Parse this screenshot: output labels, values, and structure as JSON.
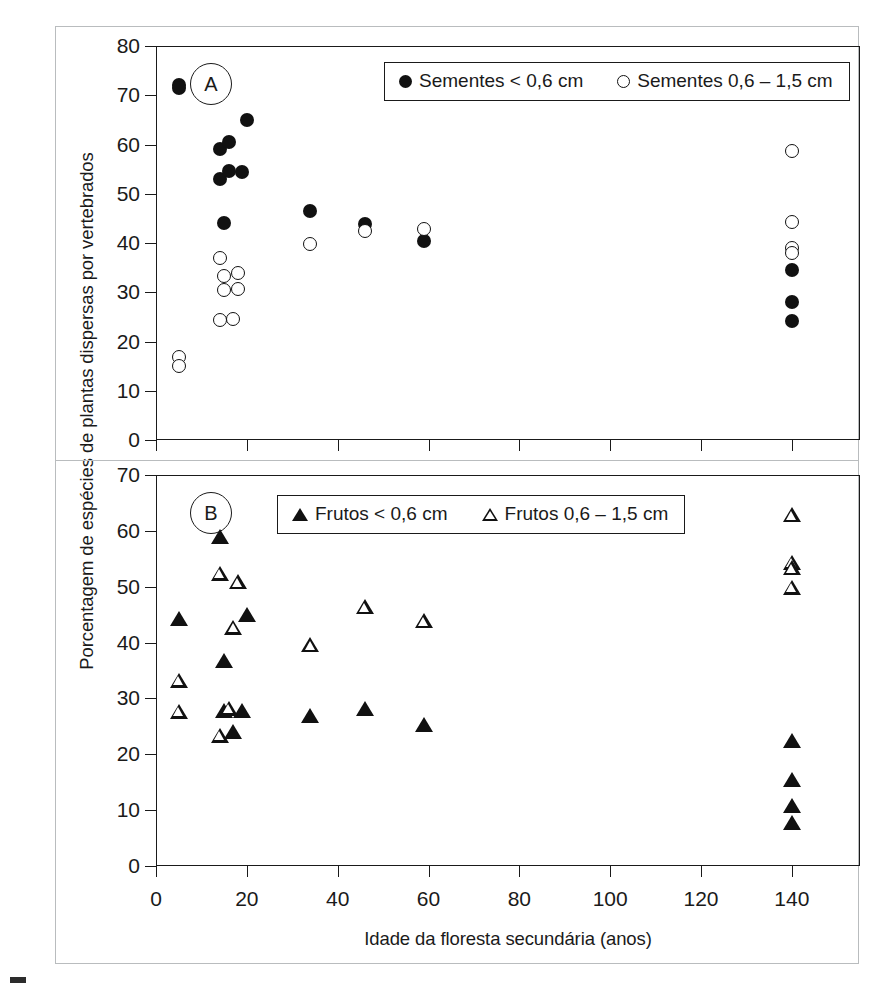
{
  "figure": {
    "ylabel": "Porcentagem de espécies de plantas dispersas por vertebrados",
    "xlabel": "Idade da floresta secundária (anos)",
    "panel_a_tag": "A",
    "panel_b_tag": "B"
  },
  "legend_a": {
    "entries": [
      {
        "marker": "filled-circle",
        "label": "Sementes < 0,6 cm"
      },
      {
        "marker": "open-circle",
        "label": "Sementes 0,6 – 1,5 cm"
      }
    ]
  },
  "legend_b": {
    "entries": [
      {
        "marker": "filled-triangle",
        "label": "Frutos < 0,6 cm"
      },
      {
        "marker": "open-triangle",
        "label": "Frutos 0,6 – 1,5 cm"
      }
    ]
  },
  "axis": {
    "x_ticks": [
      "0",
      "20",
      "40",
      "60",
      "80",
      "100",
      "120",
      "140"
    ],
    "y_ticks_a": [
      "80",
      "70",
      "60",
      "50",
      "40",
      "30",
      "20",
      "10",
      "0"
    ],
    "y_ticks_b": [
      "70",
      "60",
      "50",
      "40",
      "30",
      "20",
      "10",
      "0"
    ]
  },
  "chart_data": [
    {
      "type": "scatter",
      "panel": "A",
      "title": "Sementes",
      "xlabel": "Idade da floresta secundária (anos)",
      "ylabel": "Porcentagem de espécies de plantas dispersas por vertebrados",
      "xlim": [
        0,
        155
      ],
      "ylim": [
        0,
        80
      ],
      "xticks": [
        0,
        20,
        40,
        60,
        80,
        100,
        120,
        140
      ],
      "yticks": [
        0,
        10,
        20,
        30,
        40,
        50,
        60,
        70,
        80
      ],
      "grid": false,
      "legend_position": "top-right-inside",
      "series": [
        {
          "name": "Sementes < 0,6 cm",
          "marker": "filled-circle",
          "points": [
            {
              "x": 5,
              "y": 72.0
            },
            {
              "x": 5,
              "y": 71.5
            },
            {
              "x": 14,
              "y": 59.0
            },
            {
              "x": 16,
              "y": 60.5
            },
            {
              "x": 20,
              "y": 65.0
            },
            {
              "x": 14,
              "y": 53.0
            },
            {
              "x": 16,
              "y": 54.7
            },
            {
              "x": 19,
              "y": 54.5
            },
            {
              "x": 15,
              "y": 44.0
            },
            {
              "x": 34,
              "y": 46.5
            },
            {
              "x": 46,
              "y": 43.8
            },
            {
              "x": 59,
              "y": 40.5
            },
            {
              "x": 140,
              "y": 34.5
            },
            {
              "x": 140,
              "y": 28.0
            },
            {
              "x": 140,
              "y": 24.2
            }
          ]
        },
        {
          "name": "Sementes 0,6 – 1,5 cm",
          "marker": "open-circle",
          "points": [
            {
              "x": 5,
              "y": 16.8
            },
            {
              "x": 5,
              "y": 15.0
            },
            {
              "x": 14,
              "y": 37.0
            },
            {
              "x": 15,
              "y": 33.3
            },
            {
              "x": 18,
              "y": 34.0
            },
            {
              "x": 15,
              "y": 30.5
            },
            {
              "x": 18,
              "y": 30.6
            },
            {
              "x": 14,
              "y": 24.3
            },
            {
              "x": 17,
              "y": 24.6
            },
            {
              "x": 34,
              "y": 39.7
            },
            {
              "x": 46,
              "y": 42.5
            },
            {
              "x": 59,
              "y": 42.8
            },
            {
              "x": 140,
              "y": 58.7
            },
            {
              "x": 140,
              "y": 44.2
            },
            {
              "x": 140,
              "y": 39.0
            },
            {
              "x": 140,
              "y": 38.0
            }
          ]
        }
      ]
    },
    {
      "type": "scatter",
      "panel": "B",
      "title": "Frutos",
      "xlabel": "Idade da floresta secundária (anos)",
      "ylabel": "Porcentagem de espécies de plantas dispersas por vertebrados",
      "xlim": [
        0,
        155
      ],
      "ylim": [
        0,
        70
      ],
      "xticks": [
        0,
        20,
        40,
        60,
        80,
        100,
        120,
        140
      ],
      "yticks": [
        0,
        10,
        20,
        30,
        40,
        50,
        60,
        70
      ],
      "grid": false,
      "legend_position": "top-right-inside",
      "series": [
        {
          "name": "Frutos < 0,6 cm",
          "marker": "filled-triangle",
          "points": [
            {
              "x": 14,
              "y": 59.0
            },
            {
              "x": 5,
              "y": 44.4
            },
            {
              "x": 20,
              "y": 45.2
            },
            {
              "x": 15,
              "y": 36.8
            },
            {
              "x": 15,
              "y": 28.0
            },
            {
              "x": 19,
              "y": 28.0
            },
            {
              "x": 17,
              "y": 24.2
            },
            {
              "x": 34,
              "y": 27.0
            },
            {
              "x": 46,
              "y": 28.3
            },
            {
              "x": 59,
              "y": 25.5
            },
            {
              "x": 140,
              "y": 22.5
            },
            {
              "x": 140,
              "y": 15.5
            },
            {
              "x": 140,
              "y": 11.0
            },
            {
              "x": 140,
              "y": 7.8
            }
          ]
        },
        {
          "name": "Frutos 0,6 – 1,5 cm",
          "marker": "open-triangle",
          "points": [
            {
              "x": 14,
              "y": 52.5
            },
            {
              "x": 18,
              "y": 51.0
            },
            {
              "x": 17,
              "y": 42.8
            },
            {
              "x": 5,
              "y": 33.3
            },
            {
              "x": 5,
              "y": 27.8
            },
            {
              "x": 16,
              "y": 28.3
            },
            {
              "x": 14,
              "y": 23.5
            },
            {
              "x": 34,
              "y": 39.7
            },
            {
              "x": 46,
              "y": 46.5
            },
            {
              "x": 59,
              "y": 44.0
            },
            {
              "x": 140,
              "y": 63.0
            },
            {
              "x": 140,
              "y": 54.5
            },
            {
              "x": 140,
              "y": 53.5
            },
            {
              "x": 140,
              "y": 50.0
            }
          ]
        }
      ]
    }
  ]
}
